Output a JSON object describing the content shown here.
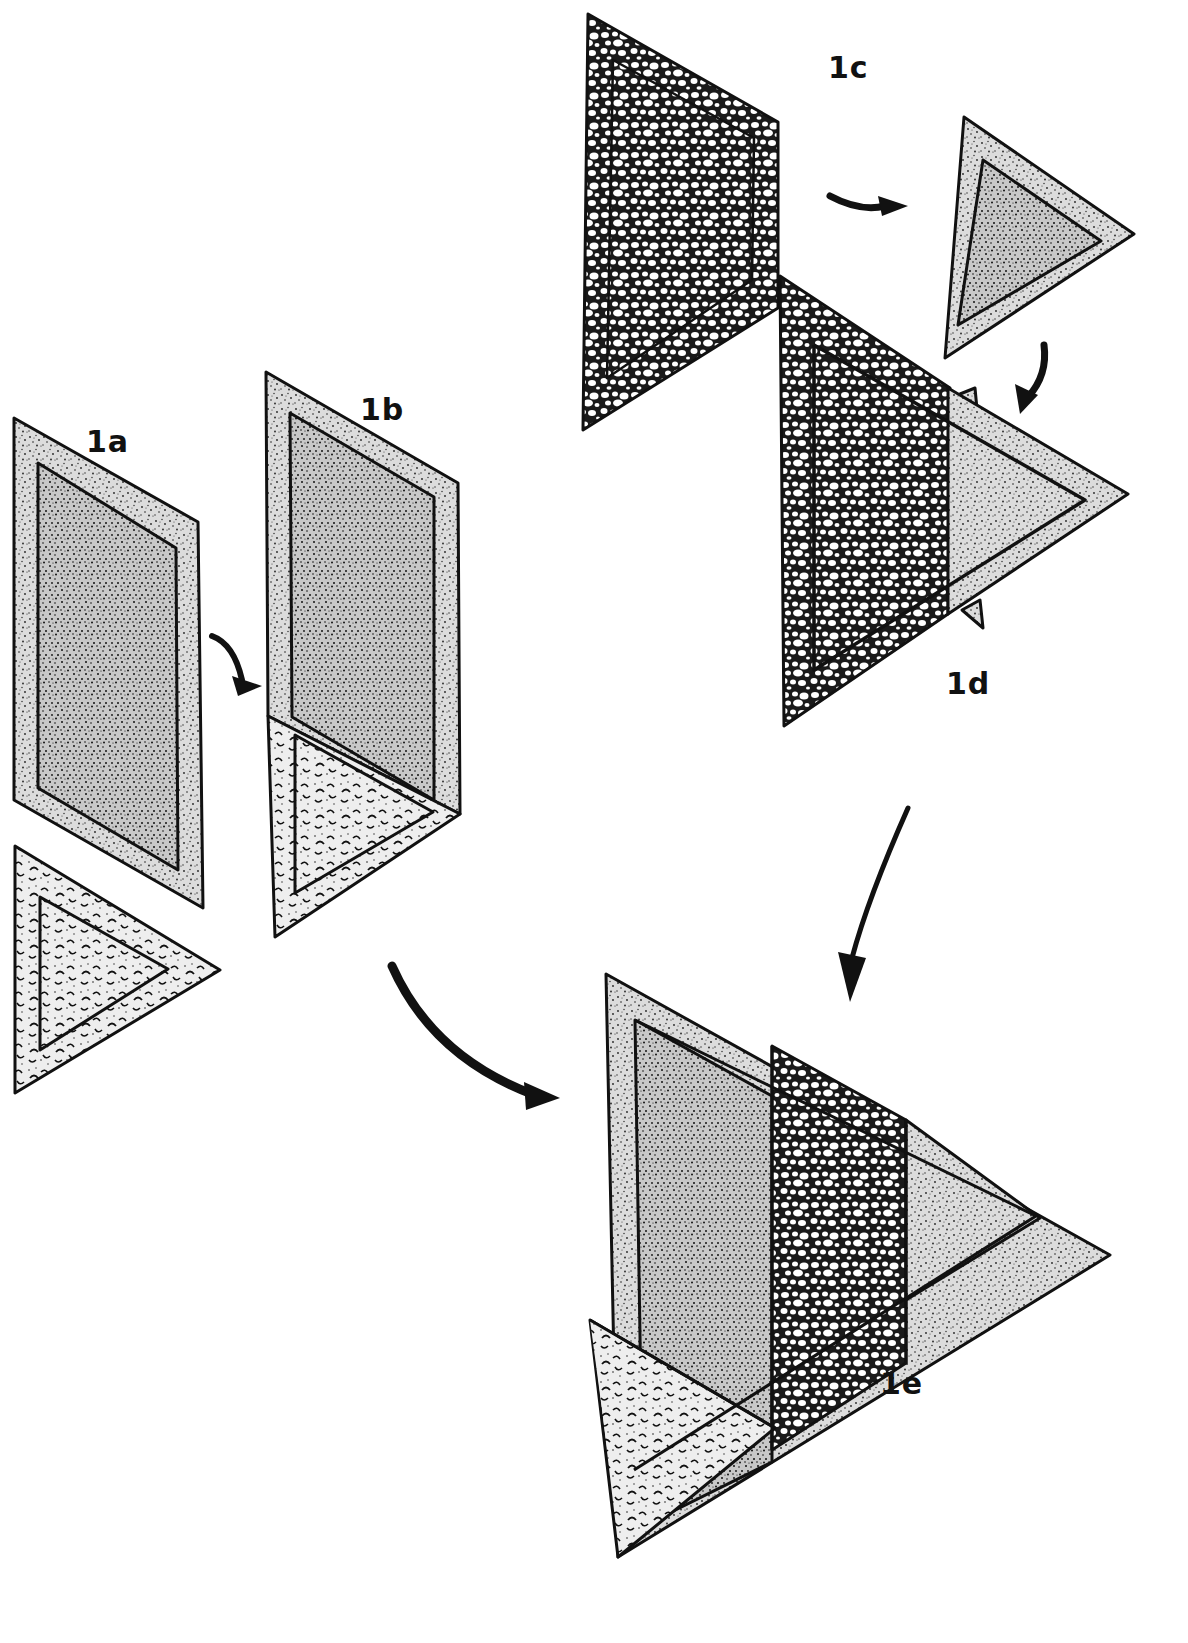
{
  "figure": {
    "colors": {
      "ink": "#111111",
      "paper": "#ffffff",
      "stipple_fill": "#d9d9d9",
      "pebble_fill": "#2a2a2a",
      "blob_fill": "#e6e6e6"
    },
    "steps": [
      {
        "id": "1a",
        "label": "1a",
        "description": "Stippled rectangle piece and blob-patterned triangle piece"
      },
      {
        "id": "1b",
        "label": "1b",
        "description": "Triangle sewn to bottom of stippled rectangle"
      },
      {
        "id": "1c",
        "label": "1c",
        "description": "Pebble-patterned triangle piece and stippled triangle piece"
      },
      {
        "id": "1d",
        "label": "1d",
        "description": "Stippled triangle sewn to pebble triangle"
      },
      {
        "id": "1e",
        "label": "1e",
        "description": "Assembled triangular block combining 1b and 1d"
      }
    ],
    "arrows": [
      {
        "name": "arrow-1a-to-1b",
        "from": "1a",
        "to": "1b"
      },
      {
        "name": "arrow-1c-to-triangle",
        "from": "1c-pebble",
        "to": "1c-stipple"
      },
      {
        "name": "arrow-triangle-to-1d",
        "from": "1c-stipple",
        "to": "1d"
      },
      {
        "name": "arrow-1b-to-1e",
        "from": "1b",
        "to": "1e"
      },
      {
        "name": "arrow-1d-to-1e",
        "from": "1d",
        "to": "1e"
      }
    ]
  }
}
